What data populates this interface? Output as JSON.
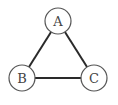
{
  "diagram": {
    "type": "graph",
    "nodes": [
      {
        "id": "A",
        "label": "A",
        "x": 58,
        "y": 21
      },
      {
        "id": "B",
        "label": "B",
        "x": 22,
        "y": 78
      },
      {
        "id": "C",
        "label": "C",
        "x": 94,
        "y": 78
      }
    ],
    "edges": [
      {
        "from": "A",
        "to": "B"
      },
      {
        "from": "A",
        "to": "C"
      },
      {
        "from": "B",
        "to": "C"
      }
    ],
    "colors": {
      "edge": "#2a2a2a",
      "node_stroke": "#555555",
      "node_fill": "#ffffff"
    }
  }
}
